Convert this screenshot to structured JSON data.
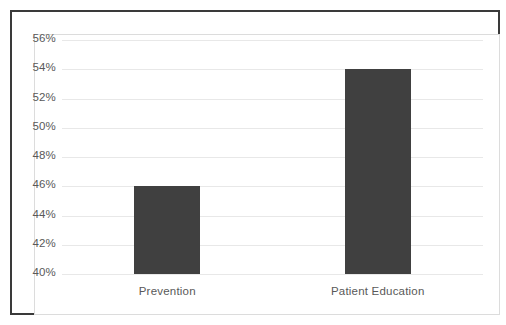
{
  "chart_data": {
    "type": "bar",
    "title": "",
    "subtitle": "",
    "xlabel": "",
    "ylabel": "",
    "categories": [
      "Prevention",
      "Patient Education"
    ],
    "values": [
      46,
      54
    ],
    "value_labels": [
      "46%",
      "54%"
    ],
    "series": [
      {
        "name": "",
        "values": [
          46,
          54
        ]
      }
    ],
    "ylim": [
      40,
      56
    ],
    "y_tick_step": 2,
    "y_tick_labels": [
      "56%",
      "54%",
      "52%",
      "50%",
      "48%",
      "46%",
      "44%",
      "42%",
      "40%"
    ],
    "y_tick_values": [
      56,
      54,
      52,
      50,
      48,
      46,
      44,
      42,
      40
    ],
    "grid": true,
    "grid_axis": "y",
    "legend": false,
    "legend_position": "none",
    "annotations": [],
    "colors": {
      "bar_fill": "#404040",
      "gridline": "#e8e8e8",
      "tick_label": "#595959",
      "outer_border": "#3a3a3a",
      "inner_border": "#dcdcdc",
      "background": "#ffffff"
    }
  }
}
